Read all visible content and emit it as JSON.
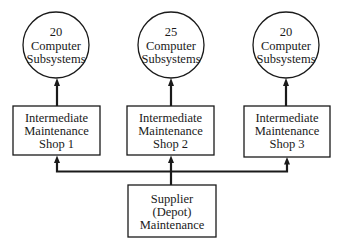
{
  "diagram": {
    "type": "maintenance-hierarchy",
    "colors": {
      "line": "#1a1a1a",
      "background": "#ffffff"
    },
    "subsystems": [
      {
        "id": "cs1",
        "count": "20",
        "line2": "Computer",
        "line3": "Subsystems"
      },
      {
        "id": "cs2",
        "count": "25",
        "line2": "Computer",
        "line3": "Subsystems"
      },
      {
        "id": "cs3",
        "count": "20",
        "line2": "Computer",
        "line3": "Subsystems"
      }
    ],
    "shops": [
      {
        "id": "shop1",
        "line1": "Intermediate",
        "line2": "Maintenance",
        "line3": "Shop 1"
      },
      {
        "id": "shop2",
        "line1": "Intermediate",
        "line2": "Maintenance",
        "line3": "Shop 2"
      },
      {
        "id": "shop3",
        "line1": "Intermediate",
        "line2": "Maintenance",
        "line3": "Shop 3"
      }
    ],
    "depot": {
      "line1": "Supplier",
      "line2": "(Depot)",
      "line3": "Maintenance"
    },
    "edges": [
      {
        "from": "depot",
        "to": "shop1"
      },
      {
        "from": "depot",
        "to": "shop2"
      },
      {
        "from": "depot",
        "to": "shop3"
      },
      {
        "from": "shop1",
        "to": "cs1"
      },
      {
        "from": "shop2",
        "to": "cs2"
      },
      {
        "from": "shop3",
        "to": "cs3"
      }
    ]
  }
}
